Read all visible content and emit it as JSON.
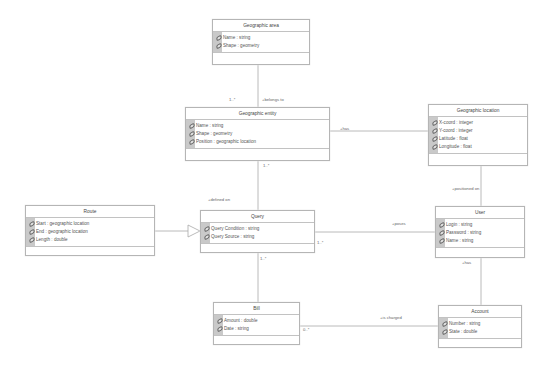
{
  "diagram": {
    "type": "UML class diagram",
    "classes": [
      {
        "id": "geographic_area",
        "name": "Geographic area",
        "attributes": [
          "Name : string",
          "Shape : geometry"
        ],
        "box": {
          "x": 212,
          "y": 19,
          "w": 98,
          "h": 46
        }
      },
      {
        "id": "geographic_entity",
        "name": "Geographic entity",
        "attributes": [
          "Name : string",
          "Shape : geometry",
          "Position : geographic location"
        ],
        "box": {
          "x": 185,
          "y": 107,
          "w": 145,
          "h": 54
        }
      },
      {
        "id": "geographic_location",
        "name": "Geographic location",
        "attributes": [
          "X-coord : integer",
          "Y-coord : integer",
          "Latitude : float",
          "Longitude : float"
        ],
        "box": {
          "x": 428,
          "y": 104,
          "w": 100,
          "h": 62
        }
      },
      {
        "id": "route",
        "name": "Route",
        "attributes": [
          "Start : geographic location",
          "End : geographic location",
          "Length : double"
        ],
        "box": {
          "x": 25,
          "y": 205,
          "w": 130,
          "h": 51
        }
      },
      {
        "id": "query",
        "name": "Query",
        "attributes": [
          "Query Condition : string",
          "Query Source : string"
        ],
        "box": {
          "x": 200,
          "y": 210,
          "w": 115,
          "h": 43
        }
      },
      {
        "id": "user",
        "name": "User",
        "attributes": [
          "Login : string",
          "Password : string",
          "Name : string"
        ],
        "box": {
          "x": 435,
          "y": 206,
          "w": 90,
          "h": 52
        }
      },
      {
        "id": "bill",
        "name": "Bill",
        "attributes": [
          "Amount : double",
          "Date : string"
        ],
        "box": {
          "x": 213,
          "y": 302,
          "w": 87,
          "h": 43
        }
      },
      {
        "id": "account",
        "name": "Account",
        "attributes": [
          "Number : string",
          "State : double"
        ],
        "box": {
          "x": 438,
          "y": 305,
          "w": 84,
          "h": 43
        }
      }
    ],
    "associations": [
      {
        "from": "geographic_entity",
        "to": "geographic_area",
        "label": "+belongs to",
        "multiplicity": "1..*"
      },
      {
        "from": "geographic_entity",
        "to": "geographic_location",
        "label": "+has",
        "multiplicity": ""
      },
      {
        "from": "query",
        "to": "geographic_entity",
        "label": "+defined on",
        "multiplicity": "1..*"
      },
      {
        "from": "user",
        "to": "geographic_location",
        "label": "+positioned on",
        "multiplicity": ""
      },
      {
        "from": "user",
        "to": "query",
        "label": "+poses",
        "multiplicity": "1..*"
      },
      {
        "from": "route",
        "to": "query",
        "label": "",
        "kind": "generalization"
      },
      {
        "from": "query",
        "to": "bill",
        "label": "",
        "multiplicity": "1..*"
      },
      {
        "from": "user",
        "to": "account",
        "label": "+has",
        "multiplicity": ""
      },
      {
        "from": "bill",
        "to": "account",
        "label": "+is charged",
        "multiplicity": "0..*"
      }
    ],
    "labels": {
      "belongs_to": "+belongs to",
      "belongs_to_mult": "1..*",
      "has_loc": "+has",
      "entity_mult": "1..*",
      "defined_on": "+defined on",
      "positioned_on": "+positioned on",
      "poses": "+poses",
      "poses_mult": "1..*",
      "query_mult": "1..*",
      "user_has": "+has",
      "is_charged": "+is charged",
      "bill_mult": "0..*"
    },
    "colors": {
      "line": "#a8a8a8",
      "border": "#b5b5b5",
      "stripe": "#c9c9c9",
      "text": "#555555"
    }
  }
}
